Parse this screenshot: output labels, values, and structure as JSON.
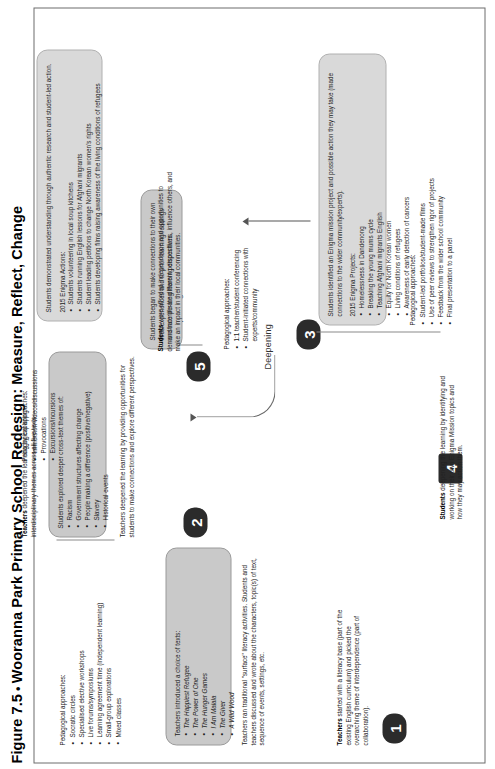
{
  "figure": {
    "label": "Figure 7.5",
    "bullet": "•",
    "title": "Wooranna Park Primary School Redesign: Measure, Reflect, Change"
  },
  "flow_labels": {
    "deepening_1": "Deepening",
    "deepening_2": "Deepening",
    "deepening_3": "Deepening"
  },
  "stages": [
    {
      "number": "1",
      "lead_bold": "Teachers",
      "lead_rest": " started with a literacy base (part of the existing English curriculum) and picked the overarching theme of interdependence (part of collaboration).",
      "panel_intro": "Teachers introduced a choice of texts:",
      "panel_items": [
        "The Happiest Refugee",
        "The Power of One",
        "The Hunger Games",
        "I Am Malala",
        "The Giver",
        "A Wild Wood"
      ],
      "panel_footer": "Teachers ran traditional \"surface\" literacy activities. Students and teachers discussed and wrote about the characters, topic(s) of text, sequence of events, settings, etc.",
      "pedagogy_header": "Pedagogical approaches:",
      "pedagogy_items": [
        "Socratic circles",
        "Specialised elective workshops",
        "Live forums/symposiums",
        "Learning agreement time (independent learning)",
        "Small-group explorations",
        "Mixed classes"
      ]
    },
    {
      "number": "2",
      "lead_bold": "Teachers",
      "lead_rest": " deepened the learning by exploring interdisciplinary themes across all five texts.",
      "panel_intro": "Students explored deeper cross-text themes of:",
      "panel_items": [
        "Racism",
        "Government structures affecting change",
        "People making a difference (positive/negative)",
        "Slavery",
        "Historical events"
      ],
      "panel_footer": "Teachers deepened the learning by providing opportunities for students to make connections and explore different perspectives.",
      "pedagogy_header": "Pedagogical approaches:",
      "pedagogy_items": [
        "Immersion videos/discussions",
        "Provocations",
        "Excursions/incursions"
      ]
    },
    {
      "number": "3",
      "lead_bold": "",
      "lead_rest": "",
      "panel_intro": "Students began to make connections to their own lives/experiences and to prior learning/readings and incorporate different perspectives.",
      "panel_items": [],
      "panel_footer": "",
      "pedagogy_header": "Pedagogical approaches:",
      "pedagogy_items": [
        "1:1 teacher/student conferencing",
        "Student-initiated connections with experts/community"
      ]
    },
    {
      "number": "4",
      "lead_bold": "Students",
      "lead_rest": " deepening the learning by identifying and working on their own Enigma Mission topics and how they may action them.",
      "panel_intro": "Students identified an Enigma mission project and possible action they may take (made connections to the wider community/experts).",
      "panel_items_header": "2015 Enigma Projects:",
      "panel_items": [
        "Homelessness in Dandenong",
        "Breaking the young mums cycle",
        "Teaching Afghani migrants English",
        "Equity for North Korean women",
        "Living conditions of refugees",
        "Awareness of early detection of cancers"
      ],
      "panel_footer": "",
      "pedagogy_header": "Pedagogical approaches:",
      "pedagogy_items": [
        "Student-led portfolios/student-made films",
        "Use of peer reviews to strengthen rigor of projects",
        "Feedback from the wider school community",
        "Final presentation to a panel"
      ]
    },
    {
      "number": "5",
      "lead_bold": "Students",
      "lead_rest": " were afforded independence and opportunities to demonstrate life-long learning dispositions, influence others, and make an impact in their local communities.",
      "panel_intro": "Students demonstrated understanding through authentic research and student-led action.",
      "panel_items_header": "2015 Enigma Actions:",
      "panel_items": [
        "Students volunteering in local soup kitchens",
        "Students running English lessons for Afghani migrants",
        "Student leading petitions to change North Korean women's rights",
        "Students developing films raising awareness of the living conditions of refugees"
      ],
      "panel_footer": "",
      "pedagogy_header": "",
      "pedagogy_items": []
    }
  ]
}
